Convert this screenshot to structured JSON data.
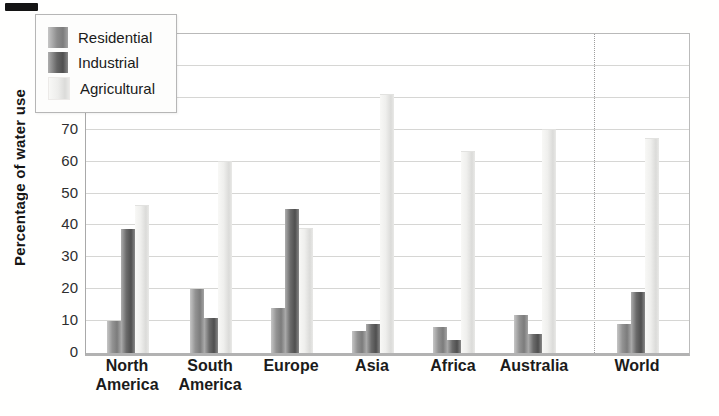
{
  "chart_data": {
    "type": "bar",
    "title": "",
    "ylabel": "Percentage of water use",
    "xlabel": "",
    "ylim": [
      0,
      100
    ],
    "yticks": [
      100,
      90,
      80,
      70,
      60,
      50,
      40,
      30,
      20,
      10,
      0
    ],
    "grid": true,
    "legend_position": "upper-left",
    "categories": [
      "North America",
      "South America",
      "Europe",
      "Asia",
      "Africa",
      "Australia",
      "World"
    ],
    "series": [
      {
        "name": "Residential",
        "values": [
          10,
          20,
          14,
          7,
          8,
          12,
          9
        ]
      },
      {
        "name": "Industrial",
        "values": [
          39,
          11,
          45,
          9,
          4,
          6,
          19
        ]
      },
      {
        "name": "Agricultural",
        "values": [
          46,
          60,
          39,
          81,
          63,
          70,
          67
        ]
      }
    ],
    "colors": {
      "residential": "#8e8e8e",
      "industrial": "#5c5c5c",
      "agricultural": "#e9e9e7"
    },
    "world_separator": true
  }
}
